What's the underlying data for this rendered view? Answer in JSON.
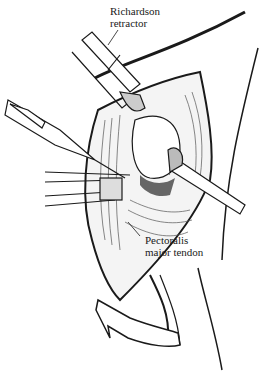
{
  "figure": {
    "labels": [
      {
        "id": "richardson",
        "lines": [
          "Richardson",
          "retractor"
        ]
      },
      {
        "id": "pectoralis",
        "lines": [
          "Pectoralis",
          "major tendon"
        ]
      }
    ],
    "elements": {
      "arrow": "curved-rotation-arrow",
      "instruments": [
        "richardson-retractor-top",
        "retractor-right",
        "forceps-left",
        "scalpel-left"
      ]
    },
    "colors": {
      "ink": "#1a1a1a",
      "background": "#ffffff",
      "shade": "#888888"
    }
  }
}
